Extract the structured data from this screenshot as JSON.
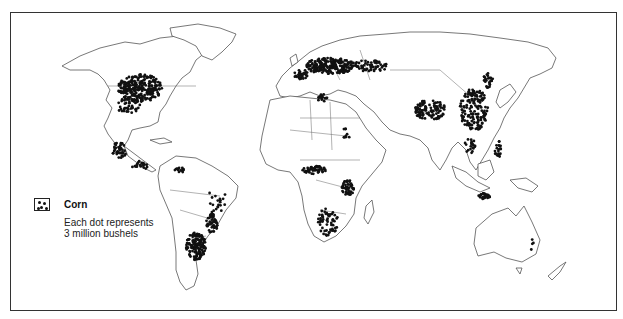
{
  "map": {
    "title": "World corn production",
    "legend": {
      "symbol": "dot-cluster-icon",
      "title": "Corn",
      "description_line1": "Each dot represents",
      "description_line2": "3 million bushels"
    },
    "dot_color": "#111111",
    "outline_color": "#555555",
    "regions_with_dense_dots": [
      "United States Corn Belt",
      "Mexico / Central America",
      "Southern Brazil / Argentina",
      "Southern Europe / Danube Basin",
      "Ukraine / Southern Russia",
      "Nigeria / West Africa",
      "East Africa",
      "Southern Africa",
      "Northern India",
      "Eastern China",
      "Java (Indonesia)",
      "Philippines",
      "Eastern Australia"
    ]
  }
}
